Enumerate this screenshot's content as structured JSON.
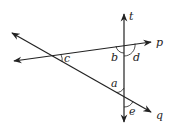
{
  "diagram": {
    "type": "geometry-lines-transversal",
    "colors": {
      "line": "#222222",
      "background": "#ffffff"
    },
    "lines": [
      {
        "name": "t",
        "x1": 124,
        "y1": 122,
        "x2": 124,
        "y2": 14,
        "arrows": "both"
      },
      {
        "name": "p",
        "x1": 14,
        "y1": 61,
        "x2": 151,
        "y2": 42,
        "arrows": "both"
      },
      {
        "name": "q",
        "x1": 12,
        "y1": 33,
        "x2": 151,
        "y2": 112,
        "arrows": "both"
      }
    ],
    "line_labels": [
      {
        "text": "t",
        "x": 129,
        "y": 20
      },
      {
        "text": "p",
        "x": 156,
        "y": 46
      },
      {
        "text": "q",
        "x": 156,
        "y": 119
      }
    ],
    "angle_labels": [
      {
        "text": "b",
        "x": 111,
        "y": 61
      },
      {
        "text": "d",
        "x": 133,
        "y": 61
      },
      {
        "text": "c",
        "x": 64,
        "y": 62
      },
      {
        "text": "a",
        "x": 111,
        "y": 87
      },
      {
        "text": "e",
        "x": 129,
        "y": 115
      }
    ]
  }
}
